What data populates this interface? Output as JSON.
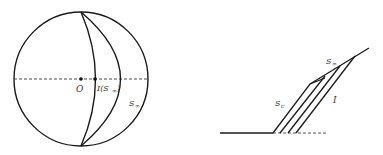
{
  "figure": {
    "left_panel": {
      "description": "Circle with dashed horizontal diameter and two arcs",
      "labels": {
        "center": "O",
        "point_I_main": "I(S",
        "point_I_sub": "∞",
        "point_I_close": ")",
        "arc_label_main": "S",
        "arc_label_sub": "∞"
      }
    },
    "right_panel": {
      "description": "Ground line with slanted parallel lines forming a wedge",
      "labels": {
        "upper_label_main": "S",
        "upper_label_sub": "∞",
        "lower_label_main": "S",
        "lower_label_sub": "c",
        "right_label": "I"
      }
    },
    "colors": {
      "stroke": "#1a1a1a",
      "text": "#333333",
      "background": "#ffffff"
    }
  }
}
